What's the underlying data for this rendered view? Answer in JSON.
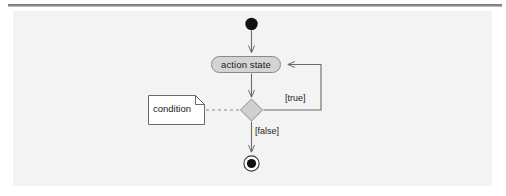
{
  "diagram": {
    "type": "uml-activity-diagram",
    "nodes": {
      "initial": {
        "name": "initial-node",
        "shape": "filled-circle",
        "label": ""
      },
      "action": {
        "name": "action-state",
        "shape": "rounded-rectangle",
        "label": "action state",
        "fill": "#d4d4d4",
        "stroke": "#8a8a8a"
      },
      "decision": {
        "name": "decision-node",
        "shape": "diamond",
        "label": "",
        "fill": "#cfcfcf",
        "stroke": "#8a8a8a"
      },
      "final": {
        "name": "final-node",
        "shape": "bullseye-circle",
        "label": ""
      },
      "note": {
        "name": "condition-note",
        "shape": "note-folded-corner",
        "label": "condition",
        "fill": "#ffffff",
        "stroke": "#6a6a6a"
      }
    },
    "edges": [
      {
        "name": "edge-initial-to-action",
        "from": "initial",
        "to": "action",
        "label": "",
        "style": "solid"
      },
      {
        "name": "edge-action-to-decision",
        "from": "action",
        "to": "decision",
        "label": "",
        "style": "solid"
      },
      {
        "name": "edge-decision-to-action",
        "from": "decision",
        "to": "action",
        "label": "[true]",
        "style": "solid"
      },
      {
        "name": "edge-decision-to-final",
        "from": "decision",
        "to": "final",
        "label": "[false]",
        "style": "solid"
      },
      {
        "name": "edge-note-to-decision",
        "from": "note",
        "to": "decision",
        "label": "",
        "style": "dashed"
      }
    ],
    "labels": {
      "action_state": "action state",
      "condition": "condition",
      "guard_true": "[true]",
      "guard_false": "[false]"
    },
    "colors": {
      "page_background": "#ffffff",
      "panel_background": "#f3f3f3",
      "line": "#6a6a6a",
      "node_fill": "#d4d4d4",
      "text": "#1a1a1a",
      "rule": "#7a7a7a"
    }
  }
}
